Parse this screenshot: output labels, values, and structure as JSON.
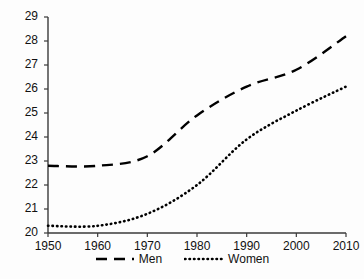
{
  "chart_data": {
    "type": "line",
    "title": "",
    "subtitle": "",
    "xlabel": "",
    "ylabel": "",
    "x": [
      1950,
      1960,
      1970,
      1980,
      1990,
      2000,
      2010
    ],
    "xlim": [
      1950,
      2010
    ],
    "ylim": [
      20,
      29
    ],
    "xticks": [
      "1950",
      "1960",
      "1970",
      "1980",
      "1990",
      "2000",
      "2010"
    ],
    "yticks": [
      "20",
      "21",
      "22",
      "23",
      "24",
      "25",
      "26",
      "27",
      "28",
      "29"
    ],
    "grid": false,
    "legend_position": "bottom-center",
    "series": [
      {
        "name": "Men",
        "style": "dashed",
        "color": "#000000",
        "values": [
          22.8,
          22.8,
          23.2,
          24.9,
          26.1,
          26.8,
          28.2
        ]
      },
      {
        "name": "Women",
        "style": "dotted",
        "color": "#000000",
        "values": [
          20.3,
          20.3,
          20.8,
          22.0,
          23.9,
          25.1,
          26.1
        ]
      }
    ],
    "annotations": []
  },
  "legend": {
    "items": [
      {
        "label": "Men",
        "style": "dashed"
      },
      {
        "label": "Women",
        "style": "dotted"
      }
    ]
  },
  "axes": {
    "y_axis_name": "value-axis",
    "x_axis_name": "year-axis"
  }
}
